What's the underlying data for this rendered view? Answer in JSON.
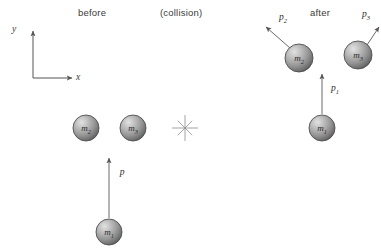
{
  "figure": {
    "background": "#ffffff",
    "ink": "#4a4a4a",
    "sphere_light": "#d8d8d8",
    "sphere_mid": "#9a9a9a",
    "sphere_dark": "#5c5c5c",
    "sphere_edge": "#4f4f4f"
  },
  "phase_labels": {
    "before": "before",
    "collision": "(collision)",
    "after": "after"
  },
  "axes": {
    "y_label": "y",
    "x_label": "x",
    "origin_x": 33,
    "origin_y": 78,
    "y_tip_y": 31,
    "x_tip_x": 72
  },
  "collision_marker": {
    "name": "collision-burst",
    "cx": 185,
    "cy": 128,
    "rays": 8,
    "radius": 13
  },
  "before": {
    "spheres": [
      {
        "id": "m1",
        "label": "m",
        "sub": "1",
        "cx": 109,
        "cy": 232,
        "r": 13
      },
      {
        "id": "m2",
        "label": "m",
        "sub": "2",
        "cx": 86,
        "cy": 128,
        "r": 13
      },
      {
        "id": "m3",
        "label": "m",
        "sub": "3",
        "cx": 133,
        "cy": 128,
        "r": 13
      }
    ],
    "momenta": [
      {
        "id": "p",
        "label": "p",
        "sub": "",
        "x1": 109,
        "y1": 218,
        "x2": 109,
        "y2": 158,
        "label_x": 122,
        "label_y": 172
      }
    ]
  },
  "after": {
    "spheres": [
      {
        "id": "m1",
        "label": "m",
        "sub": "1",
        "cx": 322,
        "cy": 128,
        "r": 13
      },
      {
        "id": "m2",
        "label": "m",
        "sub": "2",
        "cx": 299,
        "cy": 58,
        "r": 14
      },
      {
        "id": "m3",
        "label": "m",
        "sub": "3",
        "cx": 358,
        "cy": 55,
        "r": 14
      }
    ],
    "momenta": [
      {
        "id": "p1",
        "label": "p",
        "sub": "1",
        "x1": 322,
        "y1": 114,
        "x2": 322,
        "y2": 74,
        "label_x": 335,
        "label_y": 89
      },
      {
        "id": "p2",
        "label": "p",
        "sub": "2",
        "x1": 290,
        "y1": 48,
        "x2": 266,
        "y2": 27,
        "label_x": 283,
        "label_y": 18
      },
      {
        "id": "p3",
        "label": "p",
        "sub": "3",
        "x1": 367,
        "y1": 45,
        "x2": 379,
        "y2": 27,
        "label_x": 366,
        "label_y": 15
      }
    ]
  }
}
